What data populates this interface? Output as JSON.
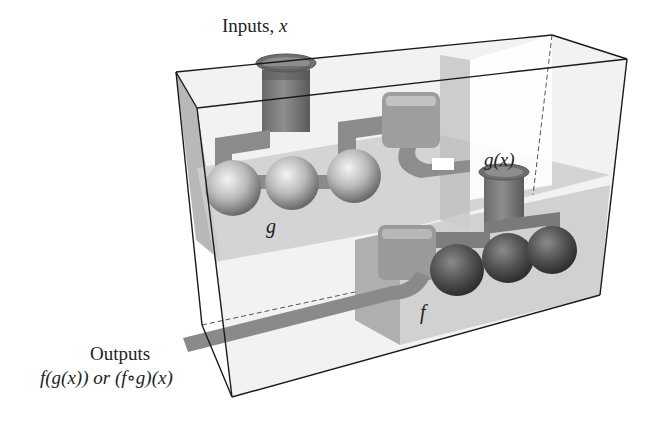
{
  "diagram": {
    "type": "function-composition-machine",
    "labels": {
      "inputs_word": "Inputs,",
      "inputs_var": "x",
      "intermediate": "g(x)",
      "machine_g": "g",
      "machine_f": "f",
      "outputs_word": "Outputs",
      "outputs_formula": "f(g(x)) or (f∘g)(x)"
    },
    "colors": {
      "box_edge": "#1a1a1a",
      "box_face": "#d9d9d9",
      "shelf": "#c8c8c8",
      "pipe": "#8a8a8a",
      "sphere_light": "#e0e0e0",
      "sphere_dark": "#4a4a4a",
      "background": "#ffffff"
    }
  }
}
